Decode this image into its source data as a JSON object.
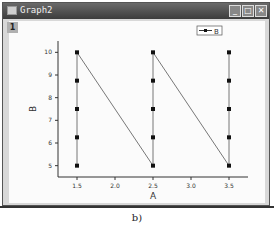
{
  "window": {
    "title": "Graph2",
    "layer_label": "1",
    "buttons": [
      "minimize",
      "maximize",
      "close"
    ]
  },
  "caption": "b)",
  "chart_data": {
    "type": "line",
    "title": "",
    "xlabel": "A",
    "ylabel": "B",
    "xlim": [
      1.25,
      3.75
    ],
    "ylim": [
      4.5,
      10.5
    ],
    "xticks": [
      "1.5",
      "2.0",
      "2.5",
      "3.0",
      "3.5"
    ],
    "yticks": [
      "5",
      "6",
      "7",
      "8",
      "9",
      "10"
    ],
    "legend": {
      "entries": [
        "B"
      ],
      "position": "top-right"
    },
    "grid": false,
    "series": [
      {
        "name": "B",
        "x": [
          1.5,
          1.5,
          1.5,
          1.5,
          1.5,
          2.5,
          2.5,
          2.5,
          2.5,
          2.5,
          3.5,
          3.5,
          3.5,
          3.5,
          3.5
        ],
        "y": [
          5,
          6.25,
          7.5,
          8.75,
          10,
          5,
          6.25,
          7.5,
          8.75,
          10,
          5,
          6.25,
          7.5,
          8.75,
          10
        ],
        "marker": "square",
        "line": true
      }
    ]
  }
}
